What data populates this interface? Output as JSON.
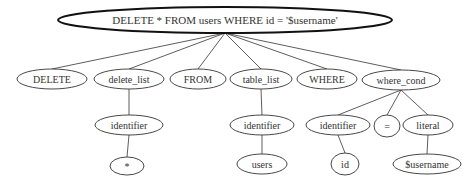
{
  "diagram": {
    "root": {
      "id": "root",
      "label": "DELETE * FROM users WHERE id = '$username'",
      "cx": 225,
      "cy": 20,
      "rx": 167,
      "ry": 13
    },
    "nodes": [
      {
        "id": "n_delete",
        "label": "DELETE",
        "cx": 52,
        "cy": 79,
        "rx": 35,
        "ry": 10
      },
      {
        "id": "n_delete_list",
        "label": "delete_list",
        "cx": 129,
        "cy": 79,
        "rx": 35,
        "ry": 10
      },
      {
        "id": "n_from",
        "label": "FROM",
        "cx": 198,
        "cy": 79,
        "rx": 28,
        "ry": 10
      },
      {
        "id": "n_table_list",
        "label": "table_list",
        "cx": 261,
        "cy": 79,
        "rx": 31,
        "ry": 10
      },
      {
        "id": "n_where",
        "label": "WHERE",
        "cx": 327,
        "cy": 79,
        "rx": 30,
        "ry": 10
      },
      {
        "id": "n_where_cond",
        "label": "where_cond",
        "cx": 401,
        "cy": 80,
        "rx": 39,
        "ry": 10
      },
      {
        "id": "n_ident1",
        "label": "identifier",
        "cx": 129,
        "cy": 125,
        "rx": 34,
        "ry": 10
      },
      {
        "id": "n_star",
        "label": "*",
        "cx": 127,
        "cy": 166,
        "rx": 17,
        "ry": 9
      },
      {
        "id": "n_ident2",
        "label": "identifier",
        "cx": 262,
        "cy": 125,
        "rx": 32,
        "ry": 10
      },
      {
        "id": "n_users",
        "label": "users",
        "cx": 262,
        "cy": 164,
        "rx": 25,
        "ry": 10
      },
      {
        "id": "n_ident3",
        "label": "identifier",
        "cx": 338,
        "cy": 125,
        "rx": 32,
        "ry": 10
      },
      {
        "id": "n_eq",
        "label": "=",
        "cx": 387,
        "cy": 126,
        "rx": 13,
        "ry": 11
      },
      {
        "id": "n_literal",
        "label": "literal",
        "cx": 428,
        "cy": 125,
        "rx": 25,
        "ry": 10
      },
      {
        "id": "n_id",
        "label": "id",
        "cx": 345,
        "cy": 164,
        "rx": 14,
        "ry": 11
      },
      {
        "id": "n_username",
        "label": "$username",
        "cx": 427,
        "cy": 164,
        "rx": 34,
        "ry": 10
      }
    ],
    "edges": [
      {
        "from": "root",
        "to": "n_delete"
      },
      {
        "from": "root",
        "to": "n_delete_list"
      },
      {
        "from": "root",
        "to": "n_from"
      },
      {
        "from": "root",
        "to": "n_table_list"
      },
      {
        "from": "root",
        "to": "n_where"
      },
      {
        "from": "root",
        "to": "n_where_cond"
      },
      {
        "from": "n_delete_list",
        "to": "n_ident1"
      },
      {
        "from": "n_ident1",
        "to": "n_star"
      },
      {
        "from": "n_table_list",
        "to": "n_ident2"
      },
      {
        "from": "n_ident2",
        "to": "n_users"
      },
      {
        "from": "n_where_cond",
        "to": "n_ident3"
      },
      {
        "from": "n_where_cond",
        "to": "n_eq"
      },
      {
        "from": "n_where_cond",
        "to": "n_literal"
      },
      {
        "from": "n_ident3",
        "to": "n_id"
      },
      {
        "from": "n_literal",
        "to": "n_username"
      }
    ],
    "colors": {
      "stroke": "#333333",
      "root_stroke": "#111111",
      "fill": "#ffffff",
      "text": "#333333"
    }
  }
}
